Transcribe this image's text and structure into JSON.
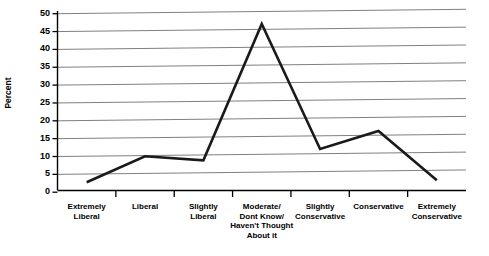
{
  "chart_data": {
    "type": "line",
    "title": "",
    "xlabel": "",
    "ylabel": "Percent",
    "categories": [
      "Extremely\nLiberal",
      "Liberal",
      "Slightly\nLiberal",
      "Moderate/\nDont Know/\nHaven't Thought\nAbout it",
      "Slightly\nConservative",
      "Conservative",
      "Extremely\nConservative"
    ],
    "values": [
      2.7,
      9.8,
      8.5,
      46.5,
      11.3,
      16.2,
      2.2
    ],
    "ylim": [
      0,
      50
    ],
    "ytick_labels": [
      "0",
      "5",
      "10",
      "15",
      "20",
      "25",
      "30",
      "35",
      "40",
      "45",
      "50"
    ],
    "ytick_values": [
      0,
      5,
      10,
      15,
      20,
      25,
      30,
      35,
      40,
      45,
      50
    ],
    "grid": true,
    "legend": false,
    "legend_position": "none",
    "series_color": "#1a1a1a",
    "grid_color": "#808080",
    "axis_color": "#000000",
    "background": "#ffffff"
  }
}
